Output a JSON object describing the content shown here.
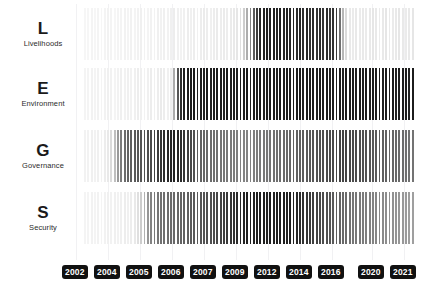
{
  "chart_data": {
    "type": "bar",
    "title": "",
    "xlabel": "",
    "ylabel": "",
    "grid": true,
    "legend_position": "none",
    "x_axis": {
      "tick_labels": [
        "2002",
        "2004",
        "2005",
        "2006",
        "2007",
        "2009",
        "2012",
        "2014",
        "2016",
        "2020",
        "2021"
      ],
      "tick_positions_px": [
        76,
        108,
        140,
        172,
        204,
        236,
        268,
        300,
        332,
        372,
        404
      ],
      "range": [
        2002,
        2021
      ]
    },
    "encoding": "Each vertical stripe is one time step; stripe darkness encodes intensity (white = lowest, black = highest).",
    "color_scale": {
      "low": "#fbfbfc",
      "mid": "#9a9a9e",
      "high": "#151517"
    },
    "series": [
      {
        "letter": "L",
        "name": "Livelihoods",
        "values": [
          2,
          2,
          3,
          2,
          3,
          2,
          3,
          4,
          3,
          2,
          3,
          3,
          4,
          3,
          4,
          3,
          4,
          5,
          4,
          3,
          4,
          4,
          5,
          4,
          5,
          4,
          5,
          6,
          5,
          4,
          5,
          6,
          5,
          6,
          5,
          6,
          7,
          6,
          5,
          6,
          7,
          6,
          7,
          6,
          7,
          8,
          9,
          12,
          20,
          34,
          52,
          70,
          84,
          92,
          95,
          96,
          95,
          96,
          94,
          96,
          93,
          95,
          92,
          94,
          90,
          93,
          89,
          92,
          88,
          91,
          87,
          90,
          86,
          89,
          85,
          88,
          84,
          60,
          30,
          14,
          8,
          7,
          8,
          7,
          8,
          7,
          8,
          9,
          8,
          7,
          8,
          9,
          8,
          7,
          8,
          9,
          8,
          7,
          8,
          9
        ]
      },
      {
        "letter": "E",
        "name": "Environment",
        "values": [
          3,
          3,
          4,
          3,
          4,
          3,
          4,
          5,
          4,
          3,
          4,
          5,
          4,
          5,
          4,
          5,
          6,
          5,
          4,
          5,
          6,
          5,
          6,
          7,
          6,
          5,
          6,
          35,
          72,
          90,
          96,
          97,
          96,
          97,
          95,
          97,
          96,
          97,
          95,
          97,
          96,
          97,
          95,
          97,
          96,
          97,
          95,
          97,
          96,
          97,
          95,
          97,
          96,
          97,
          95,
          97,
          96,
          97,
          95,
          97,
          96,
          97,
          95,
          97,
          96,
          97,
          95,
          97,
          96,
          97,
          95,
          97,
          96,
          97,
          95,
          97,
          96,
          97,
          95,
          97,
          96,
          97,
          95,
          97,
          96,
          97,
          95,
          97,
          96,
          97,
          95,
          97,
          96,
          97,
          95,
          97,
          96,
          97,
          95,
          97
        ]
      },
      {
        "letter": "G",
        "name": "Governance",
        "values": [
          4,
          4,
          5,
          4,
          5,
          4,
          6,
          8,
          14,
          26,
          42,
          55,
          62,
          66,
          68,
          70,
          71,
          72,
          73,
          75,
          77,
          80,
          83,
          86,
          89,
          92,
          94,
          95,
          93,
          90,
          86,
          82,
          78,
          74,
          70,
          67,
          65,
          63,
          62,
          61,
          60,
          59,
          58,
          57,
          56,
          55,
          54,
          53,
          52,
          52,
          53,
          54,
          55,
          56,
          57,
          58,
          59,
          60,
          61,
          62,
          63,
          64,
          65,
          66,
          67,
          68,
          69,
          70,
          71,
          72,
          73,
          74,
          75,
          76,
          77,
          78,
          79,
          80,
          80,
          79,
          78,
          77,
          76,
          75,
          74,
          73,
          72,
          71,
          70,
          69,
          68,
          67,
          66,
          65,
          64,
          63,
          62,
          61,
          60,
          59
        ]
      },
      {
        "letter": "S",
        "name": "Security",
        "values": [
          3,
          3,
          4,
          3,
          4,
          3,
          4,
          5,
          4,
          5,
          4,
          5,
          6,
          5,
          6,
          8,
          12,
          20,
          32,
          44,
          52,
          56,
          58,
          60,
          61,
          62,
          63,
          64,
          65,
          66,
          67,
          68,
          69,
          70,
          71,
          72,
          73,
          74,
          75,
          76,
          78,
          80,
          82,
          84,
          86,
          88,
          90,
          92,
          94,
          95,
          96,
          95,
          96,
          95,
          96,
          95,
          96,
          95,
          96,
          95,
          96,
          95,
          96,
          94,
          92,
          90,
          88,
          86,
          84,
          82,
          80,
          78,
          76,
          74,
          72,
          70,
          68,
          66,
          64,
          62,
          60,
          58,
          57,
          56,
          55,
          54,
          53,
          52,
          51,
          50,
          49,
          48,
          47,
          46,
          45,
          44,
          43,
          42,
          41,
          40
        ]
      }
    ]
  }
}
